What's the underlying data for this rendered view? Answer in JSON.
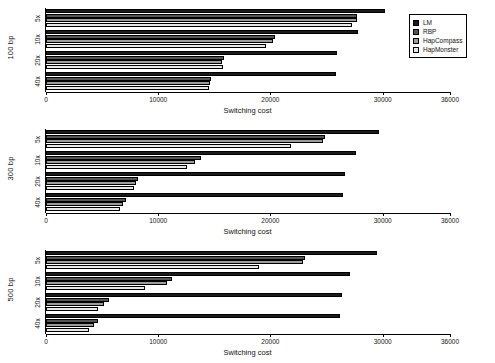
{
  "chart_data": {
    "type": "bar",
    "orientation": "horizontal",
    "title": "",
    "xlabel": "Switching cost",
    "ylabel": "",
    "xlim": [
      0,
      36000
    ],
    "xticks": [
      0,
      10000,
      20000,
      30000,
      36000
    ],
    "xticklabels": [
      "0",
      "10000",
      "20000",
      "30000",
      "36000"
    ],
    "grid": false,
    "legend_position": "top-right",
    "legend": [
      "LM",
      "RBP",
      "HapCompass",
      "HapMonster"
    ],
    "series_colors": {
      "LM": "#1b1b1b",
      "RBP": "#555555",
      "HapCompass": "#9d9d9d",
      "HapMonster": "#e8e8e8"
    },
    "categories": [
      "5x",
      "10x",
      "20x",
      "40x"
    ],
    "panels": [
      {
        "label": "100 bp",
        "categories": [
          "5x",
          "10x",
          "20x",
          "40x"
        ],
        "series": [
          {
            "name": "LM",
            "values": [
              30200,
              27800,
              25900,
              25800
            ]
          },
          {
            "name": "RBP",
            "values": [
              27700,
              20400,
              15900,
              14700
            ]
          },
          {
            "name": "HapCompass",
            "values": [
              27700,
              20200,
              15700,
              14600
            ]
          },
          {
            "name": "HapMonster",
            "values": [
              27300,
              19600,
              15800,
              14500
            ]
          }
        ]
      },
      {
        "label": "300 bp",
        "categories": [
          "5x",
          "10x",
          "20x",
          "40x"
        ],
        "series": [
          {
            "name": "LM",
            "values": [
              29700,
              27600,
              26600,
              26500
            ]
          },
          {
            "name": "RBP",
            "values": [
              24900,
              13800,
              8200,
              7100
            ]
          },
          {
            "name": "HapCompass",
            "values": [
              24700,
              13300,
              8000,
              6900
            ]
          },
          {
            "name": "HapMonster",
            "values": [
              21800,
              12600,
              7800,
              6600
            ]
          }
        ]
      },
      {
        "label": "500 bp",
        "categories": [
          "5x",
          "10x",
          "20x",
          "40x"
        ],
        "series": [
          {
            "name": "LM",
            "values": [
              29500,
              27100,
              26400,
              26200
            ]
          },
          {
            "name": "RBP",
            "values": [
              23100,
              11200,
              5600,
              4600
            ]
          },
          {
            "name": "HapCompass",
            "values": [
              22900,
              10800,
              5200,
              4300
            ]
          },
          {
            "name": "HapMonster",
            "values": [
              19000,
              8800,
              4600,
              3800
            ]
          }
        ]
      }
    ]
  }
}
